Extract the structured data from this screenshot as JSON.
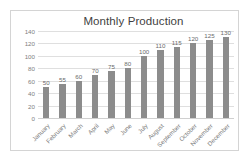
{
  "chart_data": {
    "type": "bar",
    "title": "Monthly Production",
    "xlabel": "",
    "ylabel": "",
    "categories": [
      "January",
      "February",
      "March",
      "April",
      "May",
      "June",
      "July",
      "August",
      "September",
      "October",
      "November",
      "December"
    ],
    "values": [
      50,
      55,
      60,
      70,
      75,
      80,
      100,
      110,
      115,
      120,
      125,
      130
    ],
    "data_labels": [
      "50",
      "55",
      "60",
      "70",
      "75",
      "80",
      "100",
      "110",
      "115",
      "120",
      "125",
      "130"
    ],
    "ylim": [
      0,
      140
    ],
    "yticks": [
      140,
      120,
      100,
      80,
      60,
      40,
      20,
      0
    ],
    "ytick_labels": [
      "140",
      "120",
      "100",
      "80",
      "60",
      "40",
      "20",
      "0"
    ],
    "grid": true,
    "legend": false,
    "legend_position": "none",
    "series": [
      {
        "name": "Monthly Production",
        "values": [
          50,
          55,
          60,
          70,
          75,
          80,
          100,
          110,
          115,
          120,
          125,
          130
        ]
      }
    ],
    "colors": {
      "bar": "#8c8c8c",
      "gridline": "#dfdfdf",
      "axis_text": "#808080",
      "title_text": "#3f3f3f",
      "data_label_text": "#6b6b6b",
      "frame_border": "#d4d4d4",
      "background": "#ffffff"
    }
  }
}
